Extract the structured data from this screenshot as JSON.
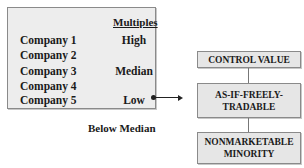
{
  "panel": {
    "header": "Multiples",
    "companies": [
      "Company 1",
      "Company 2",
      "Company 3",
      "Company 4",
      "Company 5"
    ],
    "multiples": {
      "high": "High",
      "median": "Median",
      "low": "Low"
    }
  },
  "below_label": "Below Median",
  "hierarchy": {
    "levels": [
      "CONTROL VALUE",
      "AS-IF-FREELY-TRADABLE",
      "NONMARKETABLE MINORITY"
    ]
  },
  "colors": {
    "panel_bg": "#ededed",
    "box_bg": "#e6e6e6",
    "border": "#8a8a8a",
    "text": "#1a1a1a"
  }
}
